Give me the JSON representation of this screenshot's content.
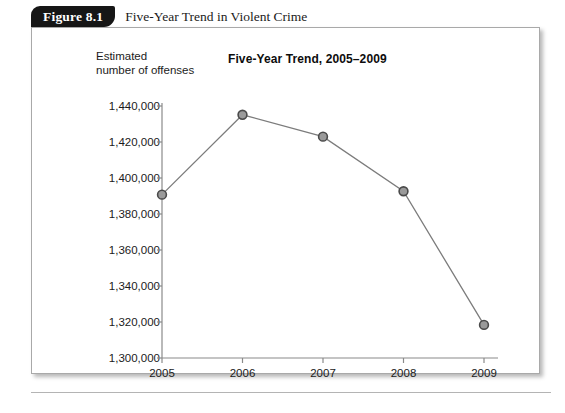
{
  "figure": {
    "tab_label": "Figure 8.1",
    "caption": "Five-Year Trend in Violent Crime"
  },
  "chart_data": {
    "type": "line",
    "title": "Five-Year Trend, 2005–2009",
    "ylabel": "Estimated\nnumber of offenses",
    "xlabel": "",
    "categories": [
      "2005",
      "2006",
      "2007",
      "2008",
      "2009"
    ],
    "values": [
      1390745,
      1435123,
      1422970,
      1392628,
      1318398
    ],
    "series": [
      {
        "name": "Estimated number of offenses",
        "values": [
          1390745,
          1435123,
          1422970,
          1392628,
          1318398
        ]
      }
    ],
    "ylim": [
      1300000,
      1440000
    ],
    "ytick_step": 20000,
    "ytick_labels": [
      "1,440,000",
      "1,420,000",
      "1,400,000",
      "1,380,000",
      "1,360,000",
      "1,340,000",
      "1,320,000",
      "1,300,000"
    ],
    "ytick_values": [
      1440000,
      1420000,
      1400000,
      1380000,
      1360000,
      1340000,
      1320000,
      1300000
    ],
    "xtick_labels": [
      "2005",
      "2006",
      "2007",
      "2008",
      "2009"
    ],
    "grid": false,
    "legend": "none",
    "colors": {
      "line": "#7c7c7c",
      "marker_fill": "#9a9a9a",
      "marker_stroke": "#4a4a4a",
      "axis": "#8a8a8a",
      "text": "#1b1b1b",
      "tab_background": "#161616",
      "panel_border": "#a9a9a9"
    }
  }
}
